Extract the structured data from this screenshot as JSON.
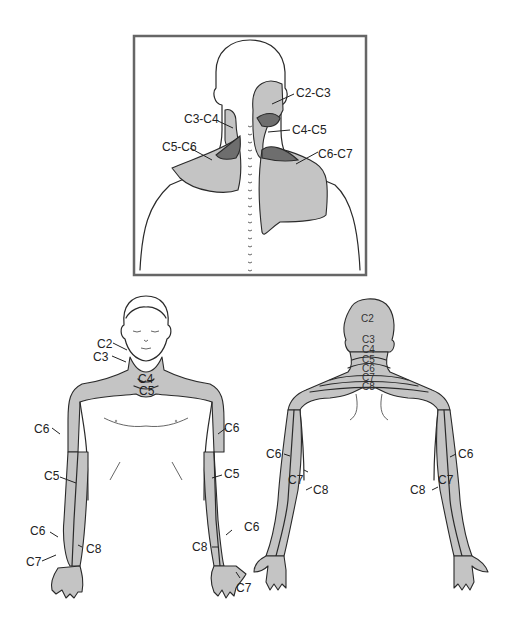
{
  "figure": {
    "inset_panel": {
      "title": "",
      "view": "posterior neck and shoulders (facet joint pain referral)",
      "border_color": "#666666",
      "zone_fill": "#c4c4c4",
      "overlap_fill": "#6e6e6e",
      "labels": [
        "C2-C3",
        "C3-C4",
        "C4-C5",
        "C5-C6",
        "C6-C7"
      ]
    },
    "anterior_view": {
      "zone_fill": "#c4c4c4",
      "labels": {
        "c2": "C2",
        "c3": "C3",
        "c4": "C4",
        "c5": "C5",
        "c6_left": "C6",
        "c6_right": "C6",
        "c5_left_arm": "C5",
        "c5_right_arm": "C5",
        "c6_left_hand": "C6",
        "c6_right_hand": "C6",
        "c7_left_hand": "C7",
        "c7_right_hand": "C7",
        "c8_left_hand": "C8",
        "c8_right_hand": "C8"
      }
    },
    "posterior_view": {
      "zone_fill": "#c4c4c4",
      "labels": {
        "c2": "C2",
        "c3": "C3",
        "c4": "C4",
        "c5": "C5",
        "c6": "C6",
        "c7": "C7",
        "c8": "C8",
        "c6_left_arm": "C6",
        "c7_left_arm": "C7",
        "c8_left_arm": "C8",
        "c6_right_arm": "C6",
        "c7_right_arm": "C7",
        "c8_right_arm": "C8"
      }
    }
  }
}
